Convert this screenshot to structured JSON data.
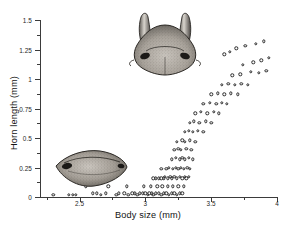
{
  "chart_data": {
    "type": "scatter",
    "title": "",
    "xlabel": "Body size (mm)",
    "ylabel": "Horn length (mm)",
    "xlim": [
      2.2,
      4.0
    ],
    "ylim": [
      0,
      1.5
    ],
    "xticks": [
      2.5,
      3.0,
      3.5,
      4.0
    ],
    "xtick_labels": [
      "2.5",
      "3",
      "3.5",
      "4"
    ],
    "xticks_minor": [
      2.25,
      2.75,
      3.25,
      3.75
    ],
    "yticks": [
      0,
      0.25,
      0.5,
      0.75,
      1.0,
      1.25,
      1.5
    ],
    "ytick_labels": [
      "0",
      "0.25",
      "0.5",
      "0.75",
      "1",
      "1.25",
      "1.5"
    ],
    "yticks_minor": [
      0.125,
      0.375,
      0.625,
      0.875,
      1.125,
      1.375
    ],
    "grid": false,
    "legend": false,
    "marker": "open-circle",
    "series": [
      {
        "name": "individuals",
        "x": [
          2.3,
          2.42,
          2.45,
          2.47,
          2.6,
          2.63,
          2.66,
          2.7,
          2.78,
          2.8,
          2.84,
          2.87,
          2.9,
          2.92,
          2.94,
          2.96,
          2.98,
          3.0,
          3.02,
          3.03,
          3.05,
          3.06,
          3.08,
          3.1,
          3.12,
          3.14,
          3.16,
          3.18,
          3.2,
          3.22,
          3.24,
          3.26,
          3.28,
          2.55,
          2.72,
          2.86,
          2.99,
          3.04,
          3.09,
          3.13,
          3.17,
          3.21,
          3.25,
          3.29,
          3.06,
          3.08,
          3.1,
          3.12,
          3.14,
          3.15,
          3.17,
          3.19,
          3.2,
          3.22,
          3.24,
          3.26,
          3.28,
          3.3,
          3.31,
          3.33,
          3.12,
          3.16,
          3.18,
          3.21,
          3.23,
          3.25,
          3.27,
          3.29,
          3.32,
          3.34,
          3.2,
          3.23,
          3.26,
          3.28,
          3.3,
          3.33,
          3.36,
          3.22,
          3.25,
          3.27,
          3.31,
          3.35,
          3.24,
          3.28,
          3.3,
          3.34,
          3.38,
          3.3,
          3.33,
          3.36,
          3.4,
          3.44,
          3.34,
          3.37,
          3.41,
          3.46,
          3.5,
          3.38,
          3.42,
          3.47,
          3.52,
          3.56,
          3.44,
          3.49,
          3.54,
          3.58,
          3.62,
          3.5,
          3.55,
          3.6,
          3.65,
          3.7,
          3.58,
          3.63,
          3.68,
          3.73,
          3.78,
          3.66,
          3.72,
          3.8,
          3.86,
          3.92,
          3.74,
          3.82,
          3.88,
          3.94,
          3.6,
          3.64,
          3.69,
          3.76,
          3.84,
          3.9
        ],
        "y": [
          0.02,
          0.02,
          0.02,
          0.02,
          0.03,
          0.03,
          0.02,
          0.03,
          0.02,
          0.03,
          0.03,
          0.02,
          0.03,
          0.03,
          0.02,
          0.03,
          0.03,
          0.03,
          0.02,
          0.03,
          0.03,
          0.02,
          0.03,
          0.03,
          0.02,
          0.03,
          0.03,
          0.02,
          0.03,
          0.03,
          0.02,
          0.03,
          0.03,
          0.09,
          0.09,
          0.09,
          0.09,
          0.09,
          0.09,
          0.09,
          0.09,
          0.09,
          0.09,
          0.09,
          0.16,
          0.16,
          0.16,
          0.16,
          0.16,
          0.17,
          0.16,
          0.17,
          0.16,
          0.17,
          0.16,
          0.17,
          0.16,
          0.17,
          0.16,
          0.17,
          0.24,
          0.24,
          0.25,
          0.24,
          0.25,
          0.24,
          0.25,
          0.24,
          0.25,
          0.24,
          0.32,
          0.33,
          0.32,
          0.33,
          0.32,
          0.33,
          0.32,
          0.4,
          0.41,
          0.4,
          0.41,
          0.4,
          0.47,
          0.48,
          0.47,
          0.48,
          0.47,
          0.55,
          0.56,
          0.55,
          0.56,
          0.55,
          0.63,
          0.64,
          0.63,
          0.64,
          0.63,
          0.71,
          0.72,
          0.71,
          0.72,
          0.71,
          0.79,
          0.8,
          0.79,
          0.8,
          0.79,
          0.87,
          0.88,
          0.87,
          0.88,
          0.87,
          0.95,
          0.96,
          0.95,
          0.96,
          0.95,
          1.03,
          1.04,
          1.06,
          1.05,
          1.07,
          1.12,
          1.14,
          1.16,
          1.18,
          1.21,
          1.23,
          1.26,
          1.28,
          1.3,
          1.32
        ]
      }
    ],
    "annotations": [
      {
        "name": "major-male-head",
        "label": "horned major male head illustration"
      },
      {
        "name": "minor-male-head",
        "label": "hornless minor male head illustration"
      }
    ]
  }
}
